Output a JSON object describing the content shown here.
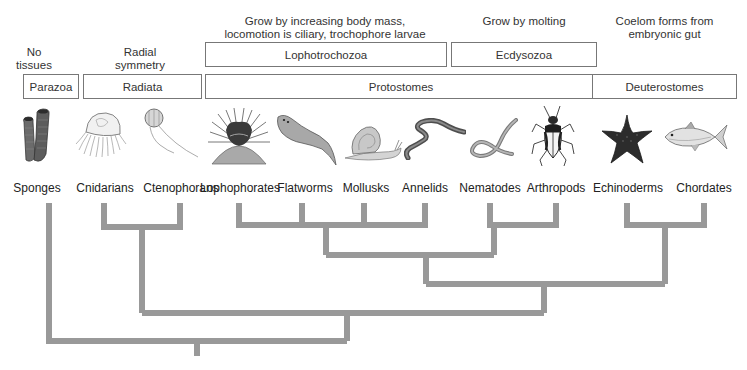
{
  "notes": {
    "parazoa": [
      "No",
      "tissues"
    ],
    "radiata": [
      "Radial",
      "symmetry"
    ],
    "lophotrochozoa": [
      "Grow by increasing body mass,",
      "locomotion is ciliary, trochophore larvae"
    ],
    "ecdysozoa": [
      "Grow by molting"
    ],
    "deuterostomes": [
      "Coelom forms from",
      "embryonic gut"
    ]
  },
  "groups_upper": {
    "lophotrochozoa": "Lophotrochozoa",
    "ecdysozoa": "Ecdysozoa"
  },
  "groups_lower": {
    "parazoa": "Parazoa",
    "radiata": "Radiata",
    "protostomes": "Protostomes",
    "deuterostomes": "Deuterostomes"
  },
  "taxa": [
    {
      "name": "Sponges",
      "icon": "sponge-icon"
    },
    {
      "name": "Cnidarians",
      "icon": "jellyfish-icon"
    },
    {
      "name": "Ctenophorans",
      "icon": "comb-jelly-icon"
    },
    {
      "name": "Lophophorates",
      "icon": "lophophorate-icon"
    },
    {
      "name": "Flatworms",
      "icon": "flatworm-icon"
    },
    {
      "name": "Mollusks",
      "icon": "snail-icon"
    },
    {
      "name": "Annelids",
      "icon": "earthworm-icon"
    },
    {
      "name": "Nematodes",
      "icon": "roundworm-icon"
    },
    {
      "name": "Arthropods",
      "icon": "beetle-icon"
    },
    {
      "name": "Echinoderms",
      "icon": "starfish-icon"
    },
    {
      "name": "Chordates",
      "icon": "fish-icon"
    }
  ],
  "tree": {
    "line_color": "#999999",
    "topology": "(Sponges,((Cnidarians,Ctenophorans),(((Lophophorates,Flatworms,Mollusks,Annelids),(Nematodes,Arthropods)),(Echinoderms,Chordates))))"
  }
}
